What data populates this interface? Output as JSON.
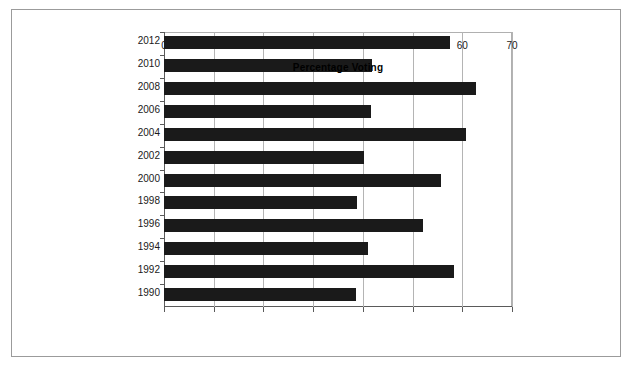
{
  "chart_data": {
    "type": "bar",
    "orientation": "horizontal",
    "title": "",
    "xlabel": "Percentage Voting",
    "ylabel": "",
    "xlim": [
      0,
      70
    ],
    "xticks": [
      0,
      10,
      20,
      30,
      40,
      50,
      60,
      70
    ],
    "xtick_labels": [
      "0",
      "10",
      "20",
      "30",
      "40",
      "50",
      "60",
      "70"
    ],
    "grid": "vertical",
    "legend": "none",
    "bar_color": "#1a1a1a",
    "categories": [
      "2012",
      "2010",
      "2008",
      "2006",
      "2004",
      "2002",
      "2000",
      "1998",
      "1996",
      "1994",
      "1992",
      "1990"
    ],
    "values": [
      57.5,
      41.8,
      62.8,
      41.6,
      60.8,
      40.2,
      55.7,
      38.8,
      52.1,
      41.0,
      58.4,
      38.6
    ],
    "bars": [
      {
        "category": "2012",
        "value": 57.5
      },
      {
        "category": "2010",
        "value": 41.8
      },
      {
        "category": "2008",
        "value": 62.8
      },
      {
        "category": "2006",
        "value": 41.6
      },
      {
        "category": "2004",
        "value": 60.8
      },
      {
        "category": "2002",
        "value": 40.2
      },
      {
        "category": "2000",
        "value": 55.7
      },
      {
        "category": "1998",
        "value": 38.8
      },
      {
        "category": "1996",
        "value": 52.1
      },
      {
        "category": "1994",
        "value": 41.0
      },
      {
        "category": "1992",
        "value": 58.4
      },
      {
        "category": "1990",
        "value": 38.6
      }
    ]
  },
  "colors": {
    "bar": "#1a1a1a",
    "grid": "#b4b4b4",
    "axis": "#5a5a5a",
    "frame": "#9b9b9b",
    "background": "#ffffff"
  }
}
